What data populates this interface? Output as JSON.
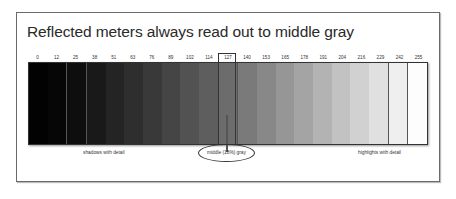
{
  "title": "Reflected meters always read out to middle gray",
  "scale": {
    "values": [
      "0",
      "12",
      "25",
      "38",
      "51",
      "63",
      "76",
      "89",
      "102",
      "114",
      "127",
      "140",
      "153",
      "165",
      "178",
      "191",
      "204",
      "216",
      "229",
      "242",
      "255"
    ],
    "colors": [
      "#020202",
      "#060606",
      "#0e0e0e",
      "#191919",
      "#242424",
      "#2e2e2e",
      "#393939",
      "#454545",
      "#525252",
      "#5e5e5e",
      "#6c6c6c",
      "#7a7a7a",
      "#888888",
      "#969696",
      "#a4a4a4",
      "#b3b3b3",
      "#c2c2c2",
      "#d1d1d1",
      "#e0e0e0",
      "#efefef",
      "#fdfdfd"
    ],
    "highlighted_value": "127"
  },
  "labels": {
    "shadows": "shadows with detail",
    "middle": "middle (18%) gray",
    "highlights": "highlights with detail"
  },
  "colors": {
    "frame": "#6a6a6a",
    "text": "#2a2a2a",
    "outline": "#333333"
  }
}
